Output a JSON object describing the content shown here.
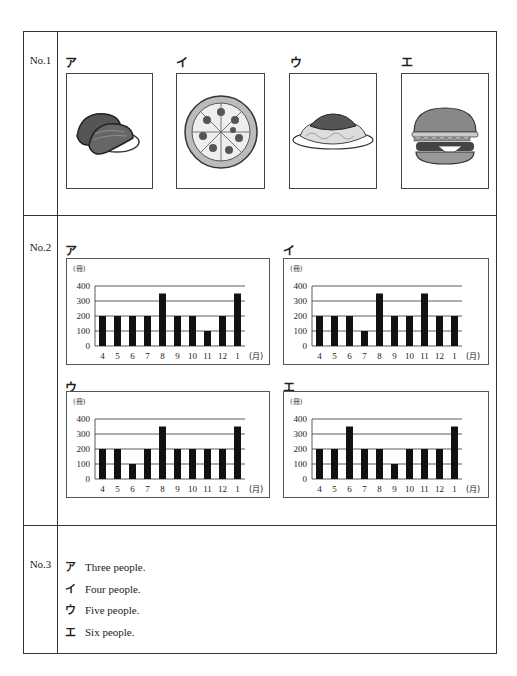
{
  "questions": {
    "q1": {
      "label": "No.1",
      "options": [
        {
          "key": "ア",
          "image": "sushi-icon"
        },
        {
          "key": "イ",
          "image": "pizza-icon"
        },
        {
          "key": "ウ",
          "image": "spaghetti-icon"
        },
        {
          "key": "エ",
          "image": "hamburger-icon"
        }
      ]
    },
    "q2": {
      "label": "No.2",
      "options": [
        {
          "key": "ア"
        },
        {
          "key": "イ"
        },
        {
          "key": "ウ"
        },
        {
          "key": "エ"
        }
      ]
    },
    "q3": {
      "label": "No.3",
      "options": [
        {
          "key": "ア",
          "text": "Three people."
        },
        {
          "key": "イ",
          "text": "Four people."
        },
        {
          "key": "ウ",
          "text": "Five people."
        },
        {
          "key": "エ",
          "text": "Six people."
        }
      ]
    }
  },
  "chart_data": [
    {
      "type": "bar",
      "title": "ア",
      "ylabel": "(冊)",
      "xlabel": "(月)",
      "categories": [
        "4",
        "5",
        "6",
        "7",
        "8",
        "9",
        "10",
        "11",
        "12",
        "1"
      ],
      "values": [
        200,
        200,
        200,
        200,
        350,
        200,
        200,
        100,
        200,
        350
      ],
      "ylim": [
        0,
        400
      ],
      "yticks": [
        0,
        100,
        200,
        300,
        400
      ],
      "grid": true
    },
    {
      "type": "bar",
      "title": "イ",
      "ylabel": "(冊)",
      "xlabel": "(月)",
      "categories": [
        "4",
        "5",
        "6",
        "7",
        "8",
        "9",
        "10",
        "11",
        "12",
        "1"
      ],
      "values": [
        200,
        200,
        200,
        100,
        350,
        200,
        200,
        350,
        200,
        200
      ],
      "ylim": [
        0,
        400
      ],
      "yticks": [
        0,
        100,
        200,
        300,
        400
      ],
      "grid": true
    },
    {
      "type": "bar",
      "title": "ウ",
      "ylabel": "(冊)",
      "xlabel": "(月)",
      "categories": [
        "4",
        "5",
        "6",
        "7",
        "8",
        "9",
        "10",
        "11",
        "12",
        "1"
      ],
      "values": [
        200,
        200,
        100,
        200,
        350,
        200,
        200,
        200,
        200,
        350
      ],
      "ylim": [
        0,
        400
      ],
      "yticks": [
        0,
        100,
        200,
        300,
        400
      ],
      "grid": true
    },
    {
      "type": "bar",
      "title": "エ",
      "ylabel": "(冊)",
      "xlabel": "(月)",
      "categories": [
        "4",
        "5",
        "6",
        "7",
        "8",
        "9",
        "10",
        "11",
        "12",
        "1"
      ],
      "values": [
        200,
        200,
        350,
        200,
        200,
        100,
        200,
        200,
        200,
        350
      ],
      "ylim": [
        0,
        400
      ],
      "yticks": [
        0,
        100,
        200,
        300,
        400
      ],
      "grid": true
    }
  ]
}
